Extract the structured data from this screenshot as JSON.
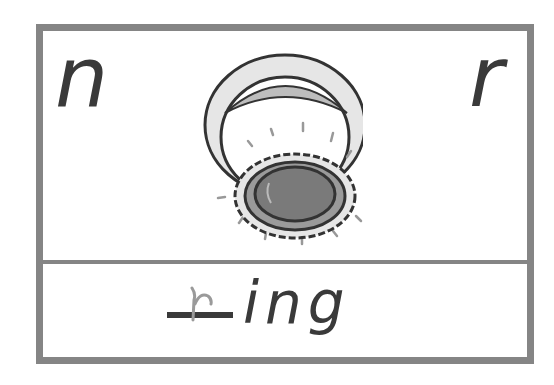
{
  "card": {
    "choice_left": "n",
    "choice_right": "r",
    "picture": "ring-icon",
    "missing_letter_hint": "r",
    "word_suffix": "ing",
    "border_color": "#858585",
    "text_color": "#3a3a3a"
  }
}
